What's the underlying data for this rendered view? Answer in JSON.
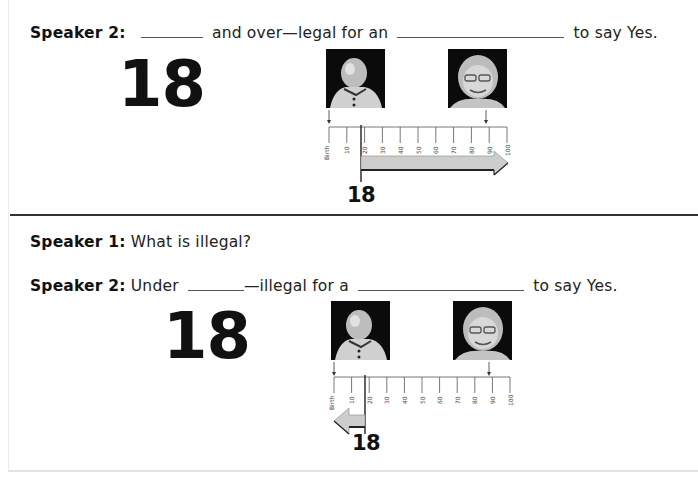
{
  "section_1": {
    "speaker": "Speaker 2:",
    "text_before_blank_1": "",
    "text_after_blank_1": "and over—legal for an",
    "text_after_blank_2": "to say Yes.",
    "big_number": "18",
    "marker_label": "18",
    "arrow_direction": "right"
  },
  "section_2": {
    "question_speaker": "Speaker 1:",
    "question_text": "What is illegal?",
    "speaker": "Speaker 2:",
    "text_before_blank_1": "Under",
    "text_after_blank_1": "—illegal for a",
    "text_after_blank_2": "to say Yes.",
    "big_number": "18",
    "marker_label": "18",
    "arrow_direction": "left"
  },
  "timeline": {
    "tick_labels": [
      "Birth",
      "10",
      "20",
      "30",
      "40",
      "50",
      "60",
      "70",
      "80",
      "90",
      "100"
    ],
    "baby_photo_alt": "baby-photo",
    "elder_photo_alt": "elderly-woman-photo"
  },
  "colors": {
    "text": "#222222",
    "divider": "#333333",
    "arrow_fill": "#c8c8c8",
    "arrow_stroke": "#222222"
  }
}
